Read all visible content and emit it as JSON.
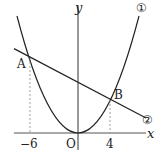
{
  "diagram": {
    "type": "coordinate-graph",
    "axes": {
      "x_label": "x",
      "y_label": "y",
      "origin_label": "O"
    },
    "ticks": {
      "x": [
        "−6",
        "4"
      ]
    },
    "points": {
      "A": {
        "label": "A",
        "x": -6
      },
      "B": {
        "label": "B",
        "x": 4
      }
    },
    "curves": {
      "parabola": {
        "label": "①",
        "equation_form": "y = ax^2"
      },
      "line": {
        "label": "②",
        "equation_form": "straight line through A and B"
      }
    },
    "colors": {
      "stroke": "#222222",
      "dashed": "#777777",
      "background": "#ffffff"
    }
  }
}
